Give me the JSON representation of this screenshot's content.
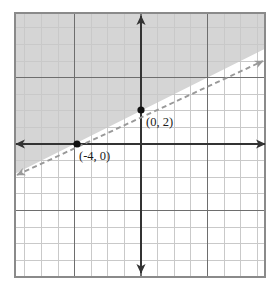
{
  "figure": {
    "name": "coordinate-plane-linear-inequality",
    "background_color": "#ffffff",
    "width": 280,
    "height": 289
  },
  "grid": {
    "left": 15,
    "top": 13,
    "right": 265,
    "bottom": 277,
    "cell_size": 16.6,
    "columns": 15,
    "rows": 16,
    "minor_color": "#c9c9c9",
    "major_color": "#6e6e6e",
    "major_every": 4,
    "border_color": "#8a8a8a",
    "visible": true
  },
  "axes": {
    "x_axis": {
      "label": "x-axis",
      "y_pixel": 144,
      "x_start": 16,
      "x_end": 265,
      "color": "#333333",
      "width": 2,
      "arrow_start": true,
      "arrow_end": true
    },
    "y_axis": {
      "label": "y-axis",
      "x_pixel": 141,
      "y_start": 16,
      "y_end": 273,
      "color": "#333333",
      "width": 2,
      "arrow_start": true,
      "arrow_end": true
    },
    "unit_pixels": 16.6,
    "origin": {
      "x_pixel": 141,
      "y_pixel": 144
    }
  },
  "chart_data": {
    "type": "line",
    "title": "",
    "xlabel": "",
    "ylabel": "",
    "graph_kind": "linear-inequality",
    "boundary_line": {
      "style": "dashed",
      "color": "#999999",
      "slope": 0.5,
      "intercept": 2,
      "equation": "y = (1/2)x + 2",
      "inclusive": false,
      "points": [
        {
          "x": -4,
          "y": 0
        },
        {
          "x": 0,
          "y": 2
        }
      ],
      "pixel_start": {
        "x": 17,
        "y": 175
      },
      "pixel_end": {
        "x": 263,
        "y": 61
      },
      "arrow_start": true,
      "arrow_end": true
    },
    "shaded_region": {
      "relation": "y > (1/2)x + 2",
      "side": "above-left",
      "color": "#d5d5d5",
      "opacity": 1
    },
    "marked_points": [
      {
        "label": "(0, 2)",
        "x": 0,
        "y": 2,
        "pixel": {
          "x": 141,
          "y": 110
        },
        "label_pixel": {
          "x": 146,
          "y": 126
        },
        "dot_color": "#111111",
        "dot_radius": 3.6
      },
      {
        "label": "(-4, 0)",
        "x": -4,
        "y": 0,
        "pixel": {
          "x": 77,
          "y": 144
        },
        "label_pixel": {
          "x": 79,
          "y": 160
        },
        "dot_color": "#111111",
        "dot_radius": 3.6
      }
    ],
    "xlim": [
      -7.6,
      7.5
    ],
    "ylim": [
      -8,
      7.9
    ],
    "grid": true,
    "legend": "none"
  }
}
